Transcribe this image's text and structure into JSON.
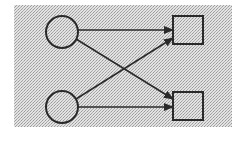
{
  "diagram": {
    "type": "bipartite-graph",
    "background": {
      "fill": "#c8c8c8",
      "pattern": "stipple",
      "x": 14,
      "y": 5,
      "width": 218,
      "height": 122
    },
    "stroke_color": "#2a2a2a",
    "node_fill": "#d4d4d4",
    "nodes": [
      {
        "id": "c1",
        "shape": "circle",
        "cx": 62,
        "cy": 32,
        "r": 16
      },
      {
        "id": "c2",
        "shape": "circle",
        "cx": 62,
        "cy": 107,
        "r": 16
      },
      {
        "id": "s1",
        "shape": "square",
        "x": 173,
        "y": 16,
        "w": 30,
        "h": 28
      },
      {
        "id": "s2",
        "shape": "square",
        "x": 173,
        "y": 92,
        "w": 30,
        "h": 28
      }
    ],
    "edges": [
      {
        "from": "c1",
        "to": "s1",
        "x1": 78,
        "y1": 30,
        "x2": 173,
        "y2": 30
      },
      {
        "from": "c1",
        "to": "s2",
        "x1": 76,
        "y1": 39,
        "x2": 173,
        "y2": 99
      },
      {
        "from": "c2",
        "to": "s1",
        "x1": 76,
        "y1": 99,
        "x2": 173,
        "y2": 38
      },
      {
        "from": "c2",
        "to": "s2",
        "x1": 78,
        "y1": 107,
        "x2": 173,
        "y2": 107
      }
    ]
  }
}
